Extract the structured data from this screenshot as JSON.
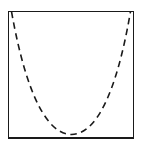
{
  "figure": {
    "kind": "geometric-diagram",
    "background_color": "#ffffff",
    "width": 145,
    "height": 152,
    "title": "",
    "caption": "",
    "frame": {
      "name": "bounding-rectangle",
      "shape": "rectangle",
      "stroke_color": "#1a1a1a",
      "stroke_width": 1.4,
      "fill": "none",
      "line_style": "solid",
      "x": 8.5,
      "y": 11.5,
      "x2": 133.5,
      "y2": 138.0,
      "box_width": 125.0,
      "box_height": 126.5
    },
    "curve": {
      "name": "dashed-parabola",
      "shape": "parabola",
      "opens": "up",
      "stroke_color": "#1a1a1a",
      "stroke_width": 1.6,
      "fill": "none",
      "line_style": "dashed",
      "dash_length": 6.5,
      "dash_gap": 4.5,
      "linecap": "butt",
      "path": "M 11.5 11.5 C 26.5 96.5 48.0 134.5 71.5 134.5 C 95.0 134.5 116.0 96.5 130.5 11.5",
      "left_endpoint": [
        11.5,
        11.5
      ],
      "right_endpoint": [
        130.5,
        11.5
      ],
      "vertex": [
        71.5,
        134.5
      ],
      "tangent_to_bottom_edge": true,
      "symmetric_about_x": 71.5
    },
    "labels": [],
    "annotations": []
  },
  "chart_data": {
    "type": "line",
    "title": "",
    "xlabel": "",
    "ylabel": "",
    "xlim": [
      8.5,
      133.5
    ],
    "ylim": [
      11.5,
      138.0
    ],
    "grid": false,
    "legend": null,
    "series": [
      {
        "name": "dashed-parabola",
        "style": "dashed",
        "color": "#1a1a1a",
        "x": [
          11.5,
          21.5,
          31.5,
          41.5,
          51.5,
          61.5,
          71.5,
          81.5,
          91.5,
          101.5,
          111.5,
          120.5,
          130.5
        ],
        "y": [
          11.5,
          53.0,
          84.0,
          105.0,
          122.0,
          131.5,
          134.5,
          131.5,
          122.0,
          105.0,
          84.0,
          57.0,
          11.5
        ]
      }
    ]
  }
}
